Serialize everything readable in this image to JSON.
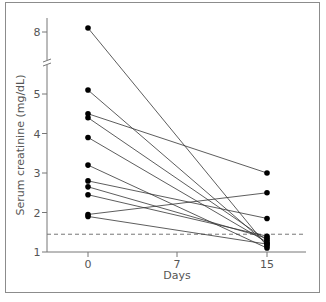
{
  "chart_data": {
    "type": "line",
    "title": "",
    "xlabel": "Days",
    "ylabel": "Serum creatinine (mg/dL)",
    "x_ticks": [
      "0",
      "7",
      "15"
    ],
    "x_tick_values": [
      0,
      7,
      15
    ],
    "y_ticks": [
      "1",
      "2",
      "3",
      "4",
      "5",
      "8"
    ],
    "y_tick_values": [
      1,
      2,
      3,
      4,
      5,
      8
    ],
    "ylim": [
      1,
      8.2
    ],
    "y_axis_break": [
      5.5,
      7.5
    ],
    "grid": false,
    "legend": null,
    "reference_line": {
      "value": 1.45,
      "style": "dashed"
    },
    "x": [
      0,
      15
    ],
    "series": [
      {
        "name": "patient-1",
        "values": [
          8.1,
          1.15
        ]
      },
      {
        "name": "patient-2",
        "values": [
          5.1,
          1.2
        ]
      },
      {
        "name": "patient-3",
        "values": [
          4.5,
          3.0
        ]
      },
      {
        "name": "patient-4",
        "values": [
          4.4,
          1.3
        ]
      },
      {
        "name": "patient-5",
        "values": [
          3.9,
          1.25
        ]
      },
      {
        "name": "patient-6",
        "values": [
          3.2,
          1.1
        ]
      },
      {
        "name": "patient-7",
        "values": [
          2.8,
          1.85
        ]
      },
      {
        "name": "patient-8",
        "values": [
          2.65,
          1.35
        ]
      },
      {
        "name": "patient-9",
        "values": [
          2.45,
          1.4
        ]
      },
      {
        "name": "patient-10",
        "values": [
          1.95,
          2.5
        ]
      },
      {
        "name": "patient-11",
        "values": [
          1.9,
          1.2
        ]
      }
    ]
  }
}
